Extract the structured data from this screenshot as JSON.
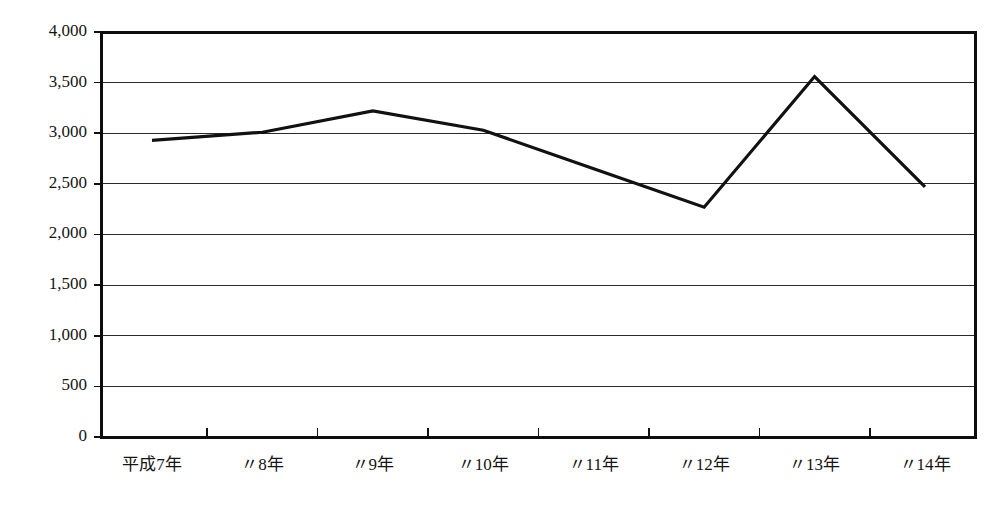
{
  "chart_data": {
    "type": "line",
    "title": "",
    "subtitle": "",
    "xlabel": "",
    "ylabel": "",
    "categories": [
      "平成7年",
      "〃8年",
      "〃9年",
      "〃10年",
      "〃11年",
      "〃12年",
      "〃13年",
      "〃14年"
    ],
    "values": [
      2930,
      3010,
      3220,
      3030,
      2650,
      2270,
      3560,
      2470
    ],
    "series": [
      {
        "name": "",
        "values": [
          2930,
          3010,
          3220,
          3030,
          2650,
          2270,
          3560,
          2470
        ]
      }
    ],
    "ylim": [
      0,
      4000
    ],
    "ytick_values": [
      0,
      500,
      1000,
      1500,
      2000,
      2500,
      3000,
      3500,
      4000
    ],
    "ytick_labels": [
      "0",
      "500",
      "1,000",
      "1,500",
      "2,000",
      "2,500",
      "3,000",
      "3,500",
      "4,000"
    ],
    "grid": true,
    "grid_axis": "y",
    "legend": false,
    "legend_position": "none",
    "line_color": "#111111",
    "grid_color": "#2a2a2a",
    "axis_color": "#0d0d0d",
    "background_color": "#ffffff",
    "markers": false,
    "annotations": []
  },
  "layout": {
    "plot_left": 101,
    "plot_right": 975,
    "plot_top": 32,
    "plot_bottom": 437,
    "xlabel_baseline": 470,
    "point_inset_left": 51,
    "point_inset_right": 50
  }
}
